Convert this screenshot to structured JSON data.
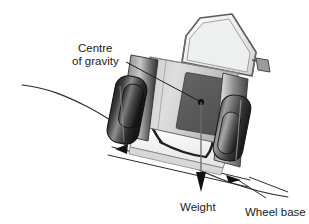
{
  "figure": {
    "background_color": "#ffffff",
    "ink_color": "#1b1b1b"
  },
  "labels": {
    "centre_of_gravity_line1": "Centre",
    "centre_of_gravity_line2": "of gravity",
    "weight": "Weight",
    "wheel_base": "Wheel base"
  },
  "annotations": {
    "centre_of_gravity_marker": "centre-of-gravity-dot",
    "weight_arrow": "downward weight vector arrow",
    "wheel_base_arrow_left": "left arrowhead on wheel base line",
    "wheel_base_arrow_right": "right arrowhead on wheel base line",
    "slope_line": "sloping ground surface line"
  },
  "colors": {
    "tyre_dark": "#2a2a2a",
    "tyre_mid": "#6e6e6e",
    "body_light": "#d9d9d9",
    "body_mid": "#b4b4b4",
    "engine_block": "#585858",
    "cab_glass": "#e4e4e4",
    "outline": "#4a4a4a",
    "chassis_white": "#f6f6f6"
  },
  "machine": {
    "parts": [
      "cab-roll-frame",
      "windscreen",
      "side-mirror",
      "bonnet-engine-block",
      "left-wheel",
      "right-wheel",
      "chassis",
      "fender-left",
      "fender-right"
    ]
  }
}
